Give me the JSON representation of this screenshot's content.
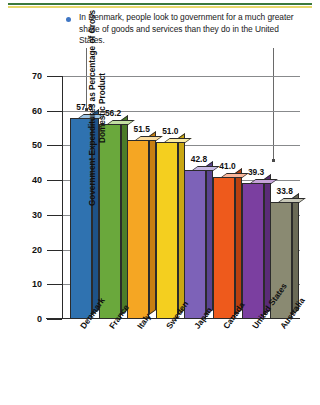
{
  "decor": {
    "rule_green_color": "#3c7a3c",
    "rule_yellow_color": "#e8d86a"
  },
  "caption": {
    "bullet_color": "#3f76c4",
    "text": "In Denmark, people look to government for a much greater share of goods and services than they do in the United States."
  },
  "annotations": [
    {
      "name": "leader-to-denmark",
      "target": "Denmark"
    },
    {
      "name": "leader-to-united-states",
      "target": "United States"
    }
  ],
  "chart_data": {
    "type": "bar",
    "title": "",
    "xlabel": "",
    "ylabel": "Government Expenditures as Percentage of Gross Domestic Product",
    "ylim": [
      0,
      70
    ],
    "yticks": [
      0,
      10,
      20,
      30,
      40,
      50,
      60,
      70
    ],
    "ytick_labels": [
      "0",
      "10",
      "20",
      "30",
      "40",
      "50",
      "60",
      "70"
    ],
    "grid": true,
    "legend": "none",
    "categories": [
      "Denmark",
      "France",
      "Italy",
      "Sweden",
      "Japan",
      "Canada",
      "United States",
      "Australia"
    ],
    "values": [
      57.8,
      56.2,
      51.5,
      51.0,
      42.8,
      41.0,
      39.3,
      33.8
    ],
    "value_labels": [
      "57.8",
      "56.2",
      "51.5",
      "51.0",
      "42.8",
      "41.0",
      "39.3",
      "33.8"
    ],
    "colors": [
      "#2f72b0",
      "#6aa83c",
      "#f5a623",
      "#f4cf1f",
      "#7d62b8",
      "#ee5a1c",
      "#7b3fa0",
      "#8a8a72"
    ],
    "colors_top": [
      "#9dc4e4",
      "#c3dfa2",
      "#fbdca0",
      "#faeca3",
      "#c7b9e3",
      "#f9b69b",
      "#c5a3d8",
      "#c8c8b8"
    ],
    "colors_side": [
      "#1e5287",
      "#4c7c29",
      "#c77f12",
      "#c9a712",
      "#5a4490",
      "#b8400f",
      "#5a2b77",
      "#6a6a56"
    ]
  }
}
